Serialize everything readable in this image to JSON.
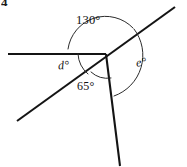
{
  "figure": {
    "question_number": "4",
    "type": "geometry-angle-diagram",
    "labels": {
      "angle_130": "130°",
      "angle_65": "65°",
      "angle_d": "d°",
      "angle_e": "e°"
    },
    "colors": {
      "line": "#141414",
      "arc": "#2b2b2b",
      "background": "#ffffff",
      "text": "#111111"
    },
    "vertex": {
      "x": 106,
      "y": 54
    },
    "lines": [
      {
        "name": "horizontal-left-ray",
        "x1": 8,
        "y1": 54,
        "x2": 106,
        "y2": 54,
        "width": 2.1
      },
      {
        "name": "diagonal-transversal",
        "x1": 17,
        "y1": 121,
        "x2": 175,
        "y2": 7,
        "width": 2.1
      },
      {
        "name": "lower-right-ray",
        "x1": 106,
        "y1": 54,
        "x2": 120,
        "y2": 166,
        "width": 2.1
      }
    ],
    "arcs": [
      {
        "name": "arc-130",
        "d": "M 68 49 A 38 38 0 0 1 133 28",
        "width": 1
      },
      {
        "name": "arc-d",
        "d": "M 78 54 A 28 28 0 0 0 88 74",
        "width": 1
      },
      {
        "name": "arc-65",
        "d": "M 91 72 A 24 24 0 0 0 111 78",
        "width": 1
      },
      {
        "name": "arc-e",
        "d": "M 134 29 A 43 43 0 0 1 114 96",
        "width": 1
      }
    ]
  }
}
